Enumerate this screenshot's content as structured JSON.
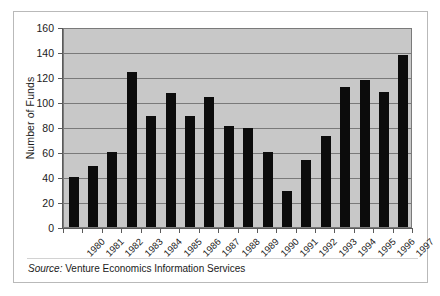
{
  "chart_data": {
    "type": "bar",
    "title": "",
    "xlabel": "",
    "ylabel": "Number of Funds",
    "ylim": [
      0,
      160
    ],
    "ytick_step": 20,
    "yticks": [
      0,
      20,
      40,
      60,
      80,
      100,
      120,
      140,
      160
    ],
    "grid": true,
    "legend": "none",
    "bar_color": "#0c0c0c",
    "plot_background": "#c8c8c8",
    "categories": [
      "1980",
      "1981",
      "1982",
      "1983",
      "1984",
      "1985",
      "1986",
      "1987",
      "1988",
      "1989",
      "1990",
      "1991",
      "1992",
      "1993",
      "1994",
      "1995",
      "1996",
      "1997"
    ],
    "values": [
      40,
      49,
      60,
      124,
      89,
      107,
      89,
      104,
      81,
      79,
      60,
      29,
      54,
      73,
      112,
      118,
      108,
      138
    ],
    "source_prefix": "Source:",
    "source_text": "Venture Economics Information Services"
  }
}
